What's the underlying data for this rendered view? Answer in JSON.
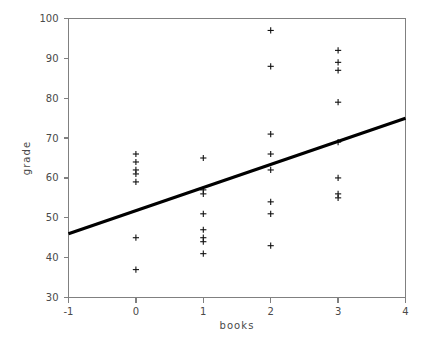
{
  "chart_data": {
    "type": "scatter",
    "title": "",
    "xlabel": "books",
    "ylabel": "grade",
    "xlim": [
      -1,
      4
    ],
    "ylim": [
      30,
      100
    ],
    "xticks": [
      -1,
      0,
      1,
      2,
      3,
      4
    ],
    "xtick_labels": [
      "-1",
      "0",
      "1",
      "2",
      "3",
      "4"
    ],
    "yticks": [
      30,
      40,
      50,
      60,
      70,
      80,
      90,
      100
    ],
    "ytick_labels": [
      "30",
      "40",
      "50",
      "60",
      "70",
      "80",
      "90",
      "100"
    ],
    "grid": false,
    "legend": "none",
    "marker": "plus",
    "marker_color": "#111111",
    "axis_color": "#808080",
    "line_color": "#000000",
    "points": [
      {
        "x": 0,
        "y": 66
      },
      {
        "x": 0,
        "y": 64
      },
      {
        "x": 0,
        "y": 62
      },
      {
        "x": 0,
        "y": 61
      },
      {
        "x": 0,
        "y": 59
      },
      {
        "x": 0,
        "y": 45
      },
      {
        "x": 0,
        "y": 37
      },
      {
        "x": 1,
        "y": 65
      },
      {
        "x": 1,
        "y": 57
      },
      {
        "x": 1,
        "y": 56
      },
      {
        "x": 1,
        "y": 51
      },
      {
        "x": 1,
        "y": 47
      },
      {
        "x": 1,
        "y": 45
      },
      {
        "x": 1,
        "y": 44
      },
      {
        "x": 1,
        "y": 41
      },
      {
        "x": 2,
        "y": 97
      },
      {
        "x": 2,
        "y": 88
      },
      {
        "x": 2,
        "y": 71
      },
      {
        "x": 2,
        "y": 66
      },
      {
        "x": 2,
        "y": 62
      },
      {
        "x": 2,
        "y": 54
      },
      {
        "x": 2,
        "y": 51
      },
      {
        "x": 2,
        "y": 43
      },
      {
        "x": 3,
        "y": 92
      },
      {
        "x": 3,
        "y": 89
      },
      {
        "x": 3,
        "y": 87
      },
      {
        "x": 3,
        "y": 79
      },
      {
        "x": 3,
        "y": 69
      },
      {
        "x": 3,
        "y": 60
      },
      {
        "x": 3,
        "y": 56
      },
      {
        "x": 3,
        "y": 55
      }
    ],
    "fit_line": {
      "label": "regression line",
      "x0": -1,
      "y0": 46,
      "x1": 4,
      "y1": 75,
      "slope": 5.8,
      "intercept": 51.8
    }
  }
}
